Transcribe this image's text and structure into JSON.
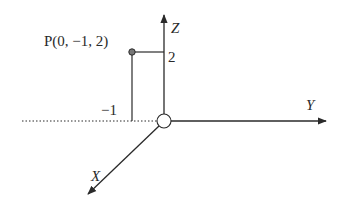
{
  "diagram": {
    "type": "3d-coordinate-axes",
    "point": {
      "label": "P(0, −1, 2)",
      "x": 0,
      "y": -1,
      "z": 2
    },
    "axes": {
      "x": {
        "label": "X"
      },
      "y": {
        "label": "Y"
      },
      "z": {
        "label": "Z"
      }
    },
    "ticks": {
      "z_tick": "2",
      "y_tick": "−1"
    },
    "colors": {
      "stroke": "#2a2a2a",
      "point_fill": "#777777",
      "background": "#ffffff"
    }
  }
}
